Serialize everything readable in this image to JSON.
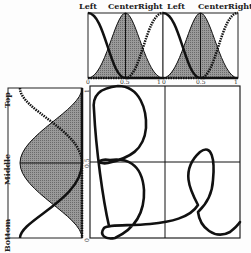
{
  "top_panels": [
    {
      "labels": {
        "left": "Left",
        "center": "Center",
        "right": "Right"
      },
      "ticks": [
        "0",
        "0.5",
        "1"
      ]
    },
    {
      "labels": {
        "left": "Left",
        "center": "Center",
        "right": "Right"
      },
      "ticks": [
        "0",
        "0.5",
        "1"
      ]
    }
  ],
  "left_panel": {
    "labels": {
      "top": "Top",
      "middle": "Middle",
      "bottom": "Bottom"
    },
    "ticks": [
      "0",
      "0.5",
      "1"
    ]
  },
  "main_panel": {
    "content": "handwritten Be",
    "grid": "2x2"
  },
  "colors": {
    "fill": "#8a8a8a",
    "stroke": "#111111"
  }
}
